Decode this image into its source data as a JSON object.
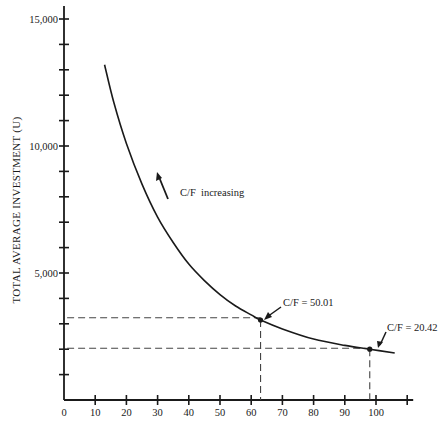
{
  "chart_data": {
    "type": "line",
    "title": "",
    "xlabel": "",
    "ylabel": "TOTAL AVERAGE INVESTMENT (U)",
    "xlim": [
      0,
      110
    ],
    "ylim": [
      0,
      15000
    ],
    "grid": false,
    "legend": null,
    "x_ticks": [
      0,
      10,
      20,
      30,
      40,
      50,
      60,
      70,
      80,
      90,
      100,
      110
    ],
    "x_tick_labels": [
      "0",
      "10",
      "20",
      "30",
      "40",
      "50",
      "60",
      "70",
      "80",
      "90",
      "100",
      ""
    ],
    "y_ticks": [
      0,
      1000,
      2000,
      3000,
      4000,
      5000,
      6000,
      7000,
      8000,
      9000,
      10000,
      11000,
      12000,
      13000,
      14000,
      15000
    ],
    "y_tick_labels": {
      "5000": "5,000",
      "10000": "10,000",
      "15000": "15,000"
    },
    "series": [
      {
        "name": "Total average investment curve",
        "x": [
          13,
          16,
          20,
          25,
          30,
          35,
          40,
          45,
          50,
          55,
          60,
          63,
          70,
          80,
          90,
          98,
          106
        ],
        "y": [
          13200,
          11700,
          10100,
          8500,
          7200,
          6200,
          5350,
          4700,
          4150,
          3700,
          3350,
          3150,
          2800,
          2400,
          2150,
          2000,
          1850
        ]
      }
    ],
    "points": [
      {
        "x": 63,
        "y": 3150,
        "label": "C/F = 50.01"
      },
      {
        "x": 98,
        "y": 2000,
        "label": "C/F = 20.42"
      }
    ],
    "reference_lines": [
      {
        "type": "horizontal",
        "y": 3240,
        "from_x": 1,
        "to_x": 63,
        "style": "dashed"
      },
      {
        "type": "vertical",
        "x": 63,
        "from_y": 3150,
        "to_y": 0,
        "style": "dashed"
      },
      {
        "type": "horizontal",
        "y": 2040,
        "from_x": 1,
        "to_x": 98,
        "style": "dashed"
      },
      {
        "type": "vertical",
        "x": 98,
        "from_y": 2000,
        "to_y": 0,
        "style": "dashed"
      }
    ],
    "annotations": [
      {
        "text": "C/F  increasing",
        "arrow": "up-left",
        "x": 35,
        "y": 8700
      }
    ]
  },
  "labels": {
    "y_axis_title": "TOTAL AVERAGE INVESTMENT (U)",
    "annotation_increasing": "C/F  increasing",
    "point1": "C/F = 50.01",
    "point2": "C/F = 20.42"
  },
  "colors": {
    "ink": "#1a1a1a",
    "dash": "#444444",
    "background": "#ffffff"
  }
}
